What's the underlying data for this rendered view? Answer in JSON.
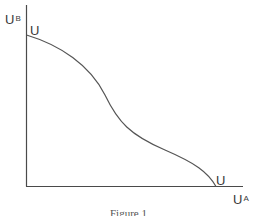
{
  "figure": {
    "y_axis_label": {
      "base": "U",
      "sup": "B"
    },
    "x_axis_label": {
      "base": "U",
      "sup": "A"
    },
    "curve_start_label": "U",
    "curve_end_label": "U",
    "caption": "Figure 1",
    "colors": {
      "axis": "#4a4a4a",
      "curve": "#555555",
      "text": "#3a3a3a"
    }
  },
  "diagram": {
    "type": "utility-possibility-frontier",
    "axes": {
      "x": "U^A",
      "y": "U^B"
    },
    "curve": "UU, downward sloping with an inflection point"
  }
}
